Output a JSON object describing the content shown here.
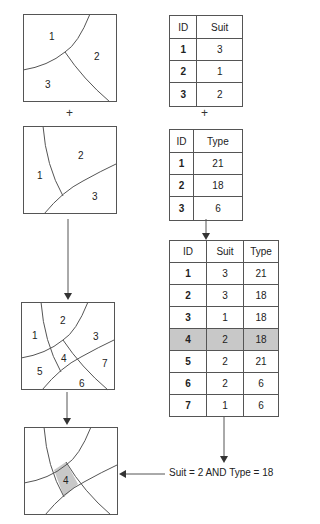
{
  "diagram": {
    "plus_symbol": "+",
    "map_a": {
      "labels": [
        "1",
        "2",
        "3"
      ]
    },
    "map_b": {
      "labels": [
        "1",
        "2",
        "3"
      ]
    },
    "map_union": {
      "labels": [
        "1",
        "2",
        "3",
        "4",
        "5",
        "6",
        "7"
      ]
    },
    "map_result": {
      "labels": [
        "4"
      ]
    },
    "table_suit": {
      "headers": [
        "ID",
        "Suit"
      ],
      "rows": [
        [
          "1",
          "3"
        ],
        [
          "2",
          "1"
        ],
        [
          "3",
          "2"
        ]
      ]
    },
    "table_type": {
      "headers": [
        "ID",
        "Type"
      ],
      "rows": [
        [
          "1",
          "21"
        ],
        [
          "2",
          "18"
        ],
        [
          "3",
          "6"
        ]
      ]
    },
    "table_union": {
      "headers": [
        "ID",
        "Suit",
        "Type"
      ],
      "rows": [
        [
          "1",
          "3",
          "21"
        ],
        [
          "2",
          "3",
          "18"
        ],
        [
          "3",
          "1",
          "18"
        ],
        [
          "4",
          "2",
          "18"
        ],
        [
          "5",
          "2",
          "21"
        ],
        [
          "6",
          "2",
          "6"
        ],
        [
          "7",
          "1",
          "6"
        ]
      ],
      "highlighted_row": "4"
    },
    "query": "Suit = 2 AND Type = 18",
    "colors": {
      "highlight": "#c8c8c8",
      "line": "#555555"
    }
  }
}
